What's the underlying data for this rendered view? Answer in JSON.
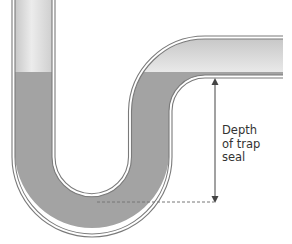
{
  "diagram": {
    "label_lines": [
      "Depth",
      "of trap",
      "seal"
    ],
    "components": {
      "pipe": "trap-pipe",
      "water": "trap-seal-water",
      "dimension_arrow": "depth-arrow",
      "reference_line": "dashed-reference-line"
    },
    "colors": {
      "water": "#a3a3a3",
      "pipe_outline": "#7a7a7a",
      "pipe_empty": "#dcdcdc",
      "arrow": "#444444",
      "text": "#333333",
      "background": "#ffffff"
    }
  }
}
